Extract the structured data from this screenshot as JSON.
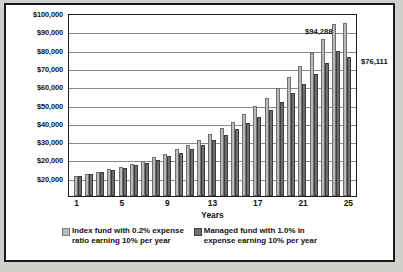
{
  "chart_data": {
    "type": "bar",
    "title": "",
    "xlabel": "Years",
    "ylabel": "",
    "ylim": [
      0,
      100000
    ],
    "grid": true,
    "legend_position": "bottom",
    "categories": [
      1,
      2,
      3,
      4,
      5,
      6,
      7,
      8,
      9,
      10,
      11,
      12,
      13,
      14,
      15,
      16,
      17,
      18,
      19,
      20,
      21,
      22,
      23,
      24,
      25
    ],
    "ytick_labels": [
      "$100,000",
      "$90,000",
      "$80,000",
      "$70,000",
      "$60,000",
      "$50,000",
      "$40,000",
      "$30,000",
      "$20,000",
      "$20,000"
    ],
    "ytick_values": [
      100000,
      90000,
      80000,
      70000,
      60000,
      50000,
      40000,
      30000,
      20000,
      10000
    ],
    "xtick_labels": [
      "1",
      "5",
      "9",
      "13",
      "17",
      "21",
      "25"
    ],
    "xtick_values": [
      1,
      5,
      9,
      13,
      17,
      21,
      25
    ],
    "series": [
      {
        "name": "Index fund with 0.2% expense ratio earning 10% per year",
        "color": "#b9b9b9",
        "values": [
          10980,
          12056,
          13237,
          14534,
          15958,
          17521,
          19237,
          21122,
          23192,
          25464,
          27959,
          30698,
          33706,
          37008,
          40634,
          44615,
          48986,
          53785,
          59054,
          64839,
          71192,
          78167,
          85826,
          94238,
          94288
        ]
      },
      {
        "name": "Managed fund with 1.0% in expense earning 10% per year",
        "color": "#6e6e6e",
        "values": [
          10900,
          11881,
          12950,
          14116,
          15386,
          16771,
          18280,
          19926,
          21719,
          23674,
          25804,
          28126,
          30657,
          33416,
          36423,
          39701,
          43274,
          47169,
          51414,
          56042,
          61086,
          66584,
          72577,
          79109,
          76111
        ]
      }
    ],
    "data_labels": [
      {
        "text": "$94,288",
        "series": "Index fund with 0.2% expense ratio earning 10% per year",
        "category": 25
      },
      {
        "text": "$76,111",
        "series": "Managed fund with 1.0% in expense earning 10% per year",
        "category": 25
      }
    ],
    "legend": [
      "Index fund with 0.2% expense\nratio earning 10% per year",
      "Managed fund with 1.0% in\nexpense earning 10% per year"
    ]
  }
}
